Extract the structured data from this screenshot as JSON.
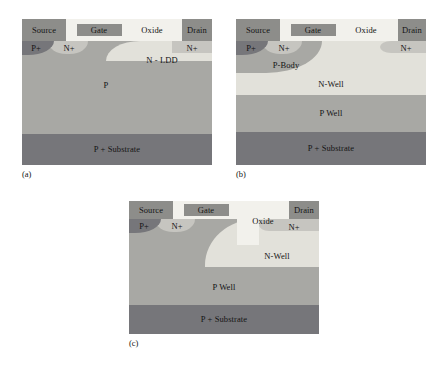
{
  "figure": {
    "type": "semiconductor-cross-section-set"
  },
  "panels": [
    {
      "id": "a",
      "caption": "(a)",
      "terminals": {
        "source": "Source",
        "gate": "Gate",
        "oxide": "Oxide",
        "drain": "Drain"
      },
      "regions": [
        {
          "name": "P+",
          "label": "P+"
        },
        {
          "name": "N+ source",
          "label": "N+"
        },
        {
          "name": "N+ drain",
          "label": "N+"
        },
        {
          "name": "N-LDD",
          "label": "N - LDD"
        },
        {
          "name": "P body",
          "label": "P"
        },
        {
          "name": "P+ substrate",
          "label": "P + Substrate"
        }
      ]
    },
    {
      "id": "b",
      "caption": "(b)",
      "terminals": {
        "source": "Source",
        "gate": "Gate",
        "oxide": "Oxide",
        "drain": "Drain"
      },
      "regions": [
        {
          "name": "P+",
          "label": "P+"
        },
        {
          "name": "N+ source",
          "label": "N+"
        },
        {
          "name": "N+ drain",
          "label": "N+"
        },
        {
          "name": "P-Body",
          "label": "P-Body"
        },
        {
          "name": "N-Well",
          "label": "N-Well"
        },
        {
          "name": "P Well",
          "label": "P Well"
        },
        {
          "name": "P+ substrate",
          "label": "P + Substrate"
        }
      ]
    },
    {
      "id": "c",
      "caption": "(c)",
      "terminals": {
        "source": "Source",
        "gate": "Gate",
        "oxide": "Oxide",
        "drain": "Drain"
      },
      "regions": [
        {
          "name": "P+",
          "label": "P+"
        },
        {
          "name": "N+ source",
          "label": "N+"
        },
        {
          "name": "N+ drain",
          "label": "N+"
        },
        {
          "name": "N-Well",
          "label": "N-Well"
        },
        {
          "name": "P Well",
          "label": "P Well"
        },
        {
          "name": "P+ substrate",
          "label": "P + Substrate"
        }
      ]
    }
  ],
  "colors": {
    "oxide": "#f2f1ec",
    "contact_metal": "#8d8d8a",
    "p_region": "#a8a8a4",
    "p_plus_substrate": "#76767a",
    "n_well": "#e2e1da",
    "n_plus": "#c6c5c0",
    "background": "#ffffff",
    "text": "#141414"
  }
}
